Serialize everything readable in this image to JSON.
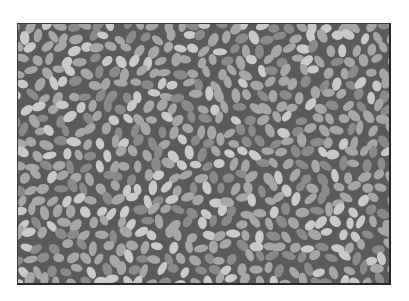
{
  "image": {
    "subject": "grayscale texture of many small light oval grains on a dark gray background",
    "frame": {
      "left": 17,
      "top": 23,
      "width": 374,
      "height": 262
    },
    "colors": {
      "background": "#5b5b5b",
      "grain_light": "#c9c9c9",
      "grain_mid": "#a6a6a6",
      "grain_dark": "#8a8a8a",
      "border": "#2a2a2a"
    },
    "grain": {
      "rx": 6.5,
      "ry": 4.2,
      "spacing": 13.5,
      "jitter": 3.2,
      "seed": 7
    }
  }
}
